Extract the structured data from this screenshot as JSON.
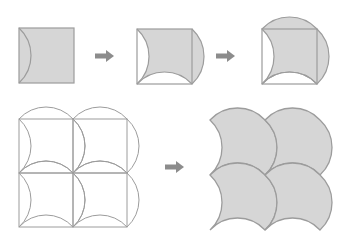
{
  "colors": {
    "tile_fill": "#d6d6d6",
    "stroke": "#9c9c9c",
    "arrow": "#8c8c8c",
    "background": "#ffffff"
  },
  "steps": [
    {
      "id": "step-1",
      "description": "Square with an inward arc drawn on its left side"
    },
    {
      "id": "step-2",
      "description": "Left cut-out moved to right side; arc drawn on bottom"
    },
    {
      "id": "step-3",
      "description": "Bottom cut-out moved to top; final curved tile"
    }
  ],
  "grid": {
    "rows": 2,
    "cols": 2,
    "description": "Outline of 2x2 tiles over square grid"
  },
  "result": {
    "rows": 2,
    "cols": 2,
    "description": "Filled tessellation of curved tiles"
  },
  "arrows": [
    {
      "id": "arrow-1",
      "direction": "right"
    },
    {
      "id": "arrow-2",
      "direction": "right"
    },
    {
      "id": "arrow-3",
      "direction": "right"
    }
  ]
}
